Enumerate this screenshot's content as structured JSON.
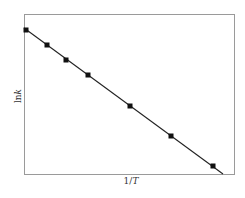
{
  "chart_data": {
    "type": "line",
    "title": "",
    "xlabel": "1/T",
    "ylabel": "lnk",
    "xlabel_parts": {
      "prefix": "1/",
      "var": "T"
    },
    "ylabel_parts": {
      "prefix": "ln",
      "var": "k"
    },
    "grid": false,
    "legend": null,
    "ticks": "none",
    "series": [
      {
        "name": "lnk vs 1/T",
        "marker": "square",
        "line": "linear fit",
        "color": "#111111",
        "points_px": [
          [
            26,
            30
          ],
          [
            47,
            45
          ],
          [
            66,
            60
          ],
          [
            88,
            75
          ],
          [
            130,
            106
          ],
          [
            171,
            136
          ],
          [
            213,
            166
          ]
        ],
        "x": [
          0.03,
          0.11,
          0.2,
          0.3,
          0.5,
          0.7,
          0.9
        ],
        "y": [
          0.91,
          0.81,
          0.71,
          0.61,
          0.4,
          0.2,
          0.0
        ]
      }
    ],
    "fit_line_px": {
      "x1": 24,
      "y1": 28,
      "x2": 223,
      "y2": 174
    },
    "frame_px": {
      "left": 24,
      "top": 14,
      "right": 234,
      "bottom": 174
    },
    "xlim": [
      0,
      1
    ],
    "ylim": [
      -0.05,
      1
    ]
  }
}
